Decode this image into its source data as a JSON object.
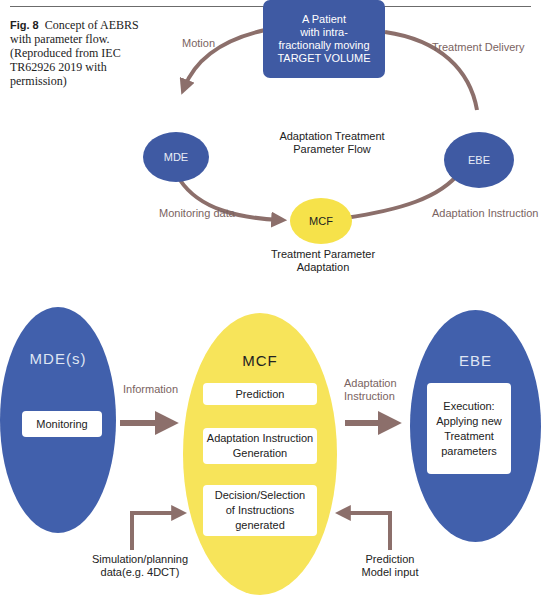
{
  "caption": {
    "label": "Fig. 8",
    "text": "Concept of AEBRS with parameter flow. (Reproduced from IEC TR62926 2019 with permission)"
  },
  "top_diagram": {
    "patient": {
      "line1": "A Patient",
      "line2": "with intra-",
      "line3": "fractionally moving",
      "line4": "TARGET VOLUME"
    },
    "nodes": {
      "mde": "MDE",
      "ebe": "EBE",
      "mcf": "MCF"
    },
    "center_title": {
      "line1": "Adaptation Treatment",
      "line2": "Parameter Flow"
    },
    "mcf_caption": {
      "line1": "Treatment Parameter",
      "line2": "Adaptation"
    },
    "edges": {
      "motion": "Motion",
      "treatment_delivery": "Treatment Delivery",
      "monitoring_data": "Monitoring data",
      "adaptation_instruction": "Adaptation Instruction"
    },
    "colors": {
      "node_blue": "#3f5aa3",
      "node_yellow": "#f6e24a",
      "arrow": "#8c6f6b"
    }
  },
  "bottom_diagram": {
    "mde": {
      "title": "MDE(s)",
      "box": "Monitoring"
    },
    "mcf": {
      "title": "MCF",
      "boxes": [
        {
          "line1": "Prediction"
        },
        {
          "line1": "Adaptation Instruction",
          "line2": "Generation"
        },
        {
          "line1": "Decision/Selection",
          "line2": "of Instructions",
          "line3": "generated"
        }
      ]
    },
    "ebe": {
      "title": "EBE",
      "box": {
        "line1": "Execution:",
        "line2": "Applying new",
        "line3": "Treatment",
        "line4": "parameters"
      }
    },
    "edges": {
      "information": "Information",
      "adaptation_instruction_1": "Adaptation",
      "adaptation_instruction_2": "Instruction"
    },
    "inputs": {
      "simulation": {
        "line1": "Simulation/planning",
        "line2": "data(e.g. 4DCT)"
      },
      "prediction": {
        "line1": "Prediction",
        "line2": "Model input"
      }
    }
  }
}
